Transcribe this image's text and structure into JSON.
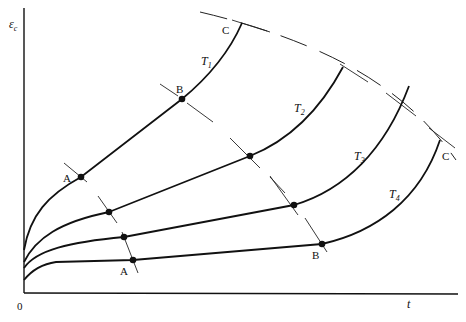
{
  "diagram": {
    "title": "",
    "y_axis_label": "ε",
    "y_axis_subscript": "c",
    "x_axis_label": "t",
    "origin_label": "0",
    "stage_points": {
      "primary_end": "A",
      "secondary_end": "B",
      "failure": "C"
    },
    "curves": [
      {
        "id": "T1",
        "label": "T",
        "subscript": "1",
        "point_labels": [
          "A",
          "B",
          "C"
        ]
      },
      {
        "id": "T2",
        "label": "T",
        "subscript": "2",
        "point_labels": []
      },
      {
        "id": "T3",
        "label": "T",
        "subscript": "3",
        "point_labels": []
      },
      {
        "id": "T4",
        "label": "T",
        "subscript": "4",
        "point_labels": [
          "A",
          "B",
          "C"
        ]
      }
    ],
    "boundary_lines": [
      {
        "name": "A-boundary",
        "style": "tick segments through first dots"
      },
      {
        "name": "B-boundary",
        "style": "tick segments through second dots"
      },
      {
        "name": "C-boundary",
        "style": "dashed curve through curve end points"
      }
    ]
  },
  "labels": {
    "T1_A": "A",
    "T1_B": "B",
    "T1_C": "C",
    "T4_A": "A",
    "T4_B": "B",
    "T4_C": "C",
    "T1": "T",
    "T1_sub": "1",
    "T2": "T",
    "T2_sub": "2",
    "T3": "T",
    "T3_sub": "3",
    "T4": "T",
    "T4_sub": "4",
    "ylabel": "ε",
    "ylabel_sub": "c",
    "xlabel": "t",
    "origin": "0"
  }
}
